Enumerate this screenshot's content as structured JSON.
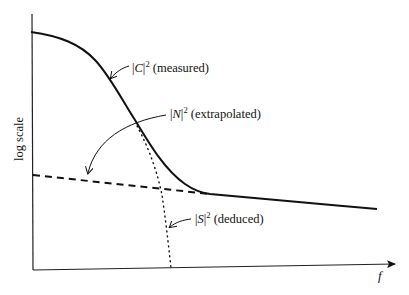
{
  "diagram": {
    "axes": {
      "y_label": "log scale",
      "x_label": "f"
    },
    "labels": {
      "C": {
        "symbol": "C",
        "exponent": "2",
        "note": "(measured)"
      },
      "N": {
        "symbol": "N",
        "exponent": "2",
        "note": "(extrapolated)"
      },
      "S": {
        "symbol": "S",
        "exponent": "2",
        "note": "(deduced)"
      }
    },
    "curves": [
      {
        "name": "|C|^2 measured",
        "style": "solid"
      },
      {
        "name": "|N|^2 extrapolated",
        "style": "dashed"
      },
      {
        "name": "|S|^2 deduced",
        "style": "dotted"
      }
    ],
    "colors": {
      "ink": "#111111",
      "background": "#ffffff"
    }
  }
}
